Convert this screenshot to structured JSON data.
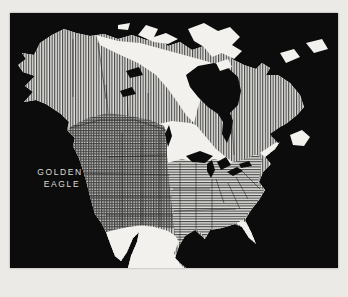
{
  "figure": {
    "species": {
      "line1": "GOLDEN",
      "line2": "EAGLE"
    },
    "colors": {
      "page_background": "#eceae6",
      "map_background": "#0c0c0c",
      "land_unshaded": "#f2f1ed",
      "hatch_line": "#454545",
      "label_text": "#dcdcdc"
    },
    "map_regions": [
      {
        "name": "vertical-hatch-region",
        "pattern": "vertical-lines",
        "area": "Alaska and most of Canada"
      },
      {
        "name": "cross-hatch-region",
        "pattern": "cross-hatch",
        "area": "western United States and southwest Canada"
      },
      {
        "name": "horizontal-hatch-region",
        "pattern": "horizontal-lines",
        "area": "central and eastern United States"
      },
      {
        "name": "unshaded-region",
        "pattern": "none",
        "area": "Mexico, Florida peninsula, Arctic tundra and islands"
      },
      {
        "name": "water",
        "pattern": "solid-black",
        "area": "oceans, Hudson Bay, Great Lakes"
      }
    ]
  }
}
